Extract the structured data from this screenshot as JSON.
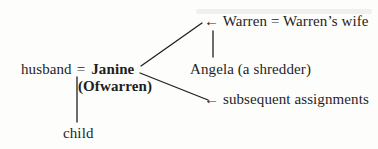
{
  "canvas": {
    "width": 378,
    "height": 149,
    "background_color": "#fdfdfb",
    "ink_color": "#1f1f1f"
  },
  "diagram": {
    "type": "kinship-diagram",
    "janine_family": {
      "husband_label": "husband",
      "equals_sign": "=",
      "handmaid_name": "Janine",
      "handmaid_patronym": "(Ofwarren)",
      "child_label": "child"
    },
    "assignments": {
      "warren_couple_label": "← Warren = Warren’s wife",
      "angela_label": "Angela (a shredder)",
      "subsequent_label": "← subsequent assignments"
    },
    "edges": [
      {
        "from": "janine",
        "to": "warren-couple",
        "style": "diagonal"
      },
      {
        "from": "janine",
        "to": "subsequent-assignments",
        "style": "diagonal"
      },
      {
        "from": "warren-couple",
        "to": "angela",
        "style": "vertical"
      },
      {
        "from": "husband-janine-union",
        "to": "child",
        "style": "vertical"
      }
    ]
  }
}
